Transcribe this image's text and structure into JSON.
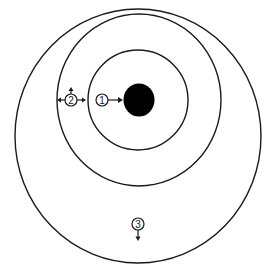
{
  "diagram": {
    "colors": {
      "stroke": "#1a1a1a",
      "core": "#000000",
      "background": "#ffffff"
    },
    "rings": [
      {
        "name": "outer-ring",
        "cx": 138,
        "cy": 136,
        "rx": 123,
        "ry": 127
      },
      {
        "name": "middle-ring",
        "cx": 139,
        "cy": 100,
        "rx": 82,
        "ry": 86
      },
      {
        "name": "inner-ring",
        "cx": 138,
        "cy": 100,
        "rx": 50,
        "ry": 50
      }
    ],
    "core": {
      "cx": 139,
      "cy": 100,
      "r": 16
    },
    "markers": [
      {
        "label": "1",
        "cx": 102,
        "cy": 100,
        "arrows": [
          "right"
        ]
      },
      {
        "label": "2",
        "cx": 71,
        "cy": 100,
        "arrows": [
          "left",
          "right",
          "up"
        ]
      },
      {
        "label": "3",
        "cx": 138,
        "cy": 224,
        "arrows": [
          "down"
        ]
      }
    ]
  }
}
